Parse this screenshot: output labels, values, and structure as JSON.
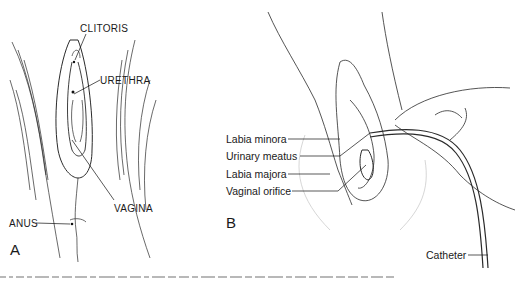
{
  "figure": {
    "panel_a": {
      "letter": "A",
      "labels": {
        "clitoris": "CLITORIS",
        "urethra": "URETHRA",
        "vagina": "VAGINA",
        "anus": "ANUS"
      }
    },
    "panel_b": {
      "letter": "B",
      "labels": {
        "labia_minora": "Labia minora",
        "urinary_meatus": "Urinary meatus",
        "labia_majora": "Labia majora",
        "vaginal_orifice": "Vaginal orifice",
        "catheter": "Catheter"
      }
    }
  },
  "colors": {
    "ink": "#1a1a1a",
    "background": "#ffffff"
  }
}
